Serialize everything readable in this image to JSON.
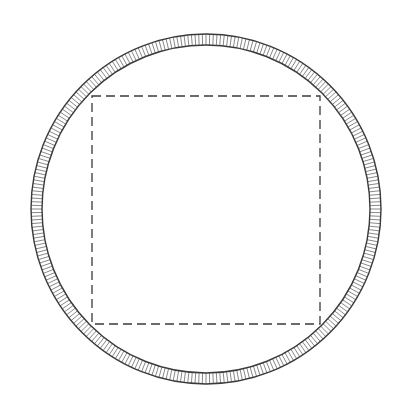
{
  "canvas": {
    "width": 418,
    "height": 412,
    "background": "#ffffff"
  },
  "ring": {
    "cx": 206,
    "cy": 209,
    "outer_r": 175,
    "inner_r": 164,
    "stroke": "#3a3a3a",
    "hatch_count": 300,
    "hatch_color": "#555555"
  },
  "dashed_square": {
    "x": 92,
    "y": 96,
    "width": 228,
    "height": 228,
    "stroke": "#3a3a3a",
    "dash": "9 5"
  }
}
